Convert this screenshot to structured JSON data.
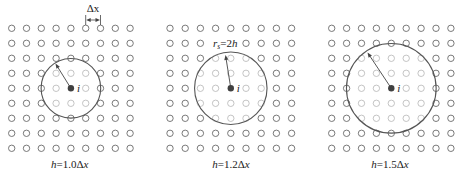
{
  "figure": {
    "colors": {
      "background": "#ffffff",
      "node_outside": "#6a6a6a",
      "node_inside": "#b5b5b5",
      "support_circle": "#555555",
      "center_particle": "#404040",
      "arrow": "#444444",
      "text": "#222222"
    },
    "node_radius_px": 3.2
  },
  "panels": [
    {
      "id": "h10",
      "h_ratio": 1.0,
      "support_radius_dx": 2.0,
      "grid": {
        "cols": 9,
        "rows": 9,
        "x0": 11.7,
        "y0": 28.3,
        "dx": 14.8,
        "dy": 15.0
      },
      "center": {
        "col": 4,
        "row": 4,
        "label": "i"
      },
      "arrow_tip": {
        "x": 55.5,
        "y": 63.5
      },
      "caption": {
        "var_h": "h",
        "mid": "=1.0Δ",
        "var_x": "x",
        "x": 69.7,
        "y": 168
      },
      "dimension": {
        "label": "Δx",
        "col_a": 5,
        "col_b": 6,
        "y_top": 15,
        "y_bottom": 25,
        "y_arrow": 20,
        "label_y": 12
      },
      "radius_label": null,
      "hidden_nodes": []
    },
    {
      "id": "h12",
      "h_ratio": 1.2,
      "support_radius_dx": 2.4,
      "grid": {
        "cols": 9,
        "rows": 9,
        "x0": 170.0,
        "y0": 28.3,
        "dx": 15.2,
        "dy": 15.0
      },
      "center": {
        "col": 4,
        "row": 4,
        "label": "i"
      },
      "arrow_tip": {
        "x": 225.5,
        "y": 55.0
      },
      "caption": {
        "var_h": "h",
        "mid": "=1.2Δ",
        "var_x": "x",
        "x": 231,
        "y": 168
      },
      "dimension": null,
      "radius_label": {
        "r": "r",
        "sub": "s",
        "mid": "=2",
        "h": "h",
        "x": 213,
        "y": 46.5
      },
      "hidden_nodes": [
        [
          3,
          1
        ],
        [
          4,
          1
        ]
      ]
    },
    {
      "id": "h15",
      "h_ratio": 1.5,
      "support_radius_dx": 3.0,
      "grid": {
        "cols": 9,
        "rows": 9,
        "x0": 331.7,
        "y0": 28.3,
        "dx": 14.9,
        "dy": 15.0
      },
      "center": {
        "col": 4,
        "row": 4,
        "label": "i"
      },
      "arrow_tip": {
        "x": 367.5,
        "y": 52.5
      },
      "caption": {
        "var_h": "h",
        "mid": "=1.5Δ",
        "var_x": "x",
        "x": 390,
        "y": 168
      },
      "dimension": null,
      "radius_label": null,
      "hidden_nodes": []
    }
  ]
}
